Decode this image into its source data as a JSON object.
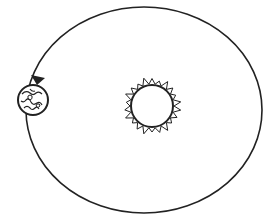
{
  "diagram": {
    "title": "",
    "elements": {
      "orbit": {
        "shape": "ellipse",
        "cx": 144,
        "cy": 110,
        "rx": 118,
        "ry": 103,
        "stroke": "#222222"
      },
      "sun": {
        "cx": 152,
        "cy": 106,
        "r": 21,
        "flame_outer_r": 29,
        "stroke": "#222222"
      },
      "earth": {
        "cx": 33,
        "cy": 100,
        "r": 15,
        "stroke": "#222222"
      },
      "direction_arrow": {
        "points_to": "earth",
        "direction": "counterclockwise"
      }
    },
    "colors": {
      "line": "#222222",
      "background": "#ffffff"
    }
  }
}
